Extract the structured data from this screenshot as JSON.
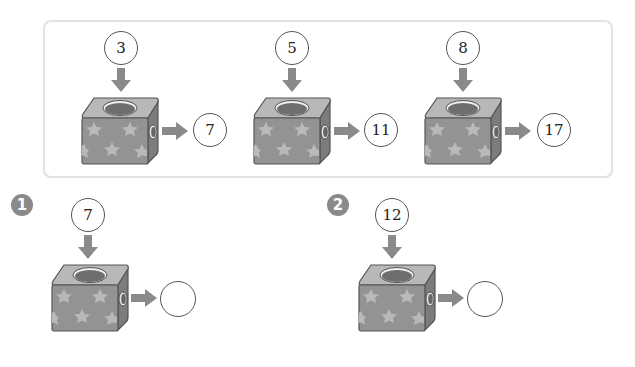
{
  "colors": {
    "panel_border": "#e2e2e2",
    "cube_face": "#8f8f8f",
    "cube_top": "#b5b5b5",
    "cube_side": "#7a7a7a",
    "arrow": "#8a8a8a",
    "badge": "#8a8a8a"
  },
  "examples": [
    {
      "input": "3",
      "output": "7"
    },
    {
      "input": "5",
      "output": "11"
    },
    {
      "input": "8",
      "output": "17"
    }
  ],
  "questions": [
    {
      "number": "1",
      "input": "7",
      "output": ""
    },
    {
      "number": "2",
      "input": "12",
      "output": ""
    }
  ]
}
